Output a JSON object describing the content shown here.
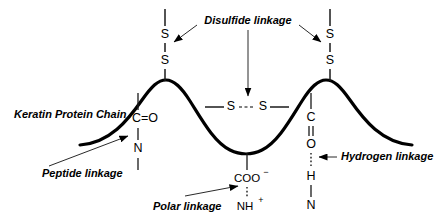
{
  "diagram": {
    "background_color": "#ffffff",
    "stroke_color": "#000000",
    "labels": {
      "keratin_protein_chain": "Keratin Protein Chain",
      "disulfide_linkage": "Disulfide linkage",
      "peptide_linkage": "Peptide linkage",
      "polar_linkage": "Polar linkage",
      "hydrogen_linkage": "Hydrogen linkage"
    },
    "atoms": {
      "sulfur": "S",
      "carbon": "C",
      "oxygen": "O",
      "nitrogen": "N",
      "hydrogen": "H",
      "carbonyl_group": "C=O",
      "carboxylate": "COO",
      "carboxylate_charge": "−",
      "ammonium": "NH",
      "ammonium_charge": "+"
    },
    "left_disulfide": {
      "upper_sulfur": "S",
      "lower_sulfur": "S"
    },
    "right_disulfide": {
      "upper_sulfur": "S",
      "lower_sulfur": "S"
    },
    "bridge_disulfide": {
      "left_sulfur": "S",
      "right_sulfur": "S"
    },
    "peptide_group": {
      "carbonyl": "C=O",
      "amide_nitrogen": "N"
    },
    "polar_group": {
      "acid": "COO",
      "acid_charge": "−",
      "base": "NH",
      "base_charge": "+"
    },
    "hydrogen_group": {
      "carbon": "C",
      "oxygen": "O",
      "hydrogen": "H",
      "nitrogen": "N"
    }
  }
}
